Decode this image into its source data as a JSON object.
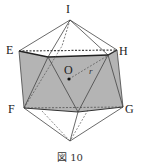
{
  "figure": {
    "caption": "図 10",
    "shape": "icosahedron",
    "fill_color": "#b4b4b4",
    "line_color": "#333333",
    "vertices": {
      "I": {
        "label": "I",
        "x": 70,
        "y": 20
      },
      "E": {
        "label": "E",
        "x": 19,
        "y": 51
      },
      "H": {
        "label": "H",
        "x": 117,
        "y": 50
      },
      "F": {
        "label": "F",
        "x": 24,
        "y": 108
      },
      "G": {
        "label": "G",
        "x": 123,
        "y": 107
      },
      "O": {
        "label": "O",
        "x": 69,
        "y": 79
      }
    },
    "radius_label": "r"
  }
}
